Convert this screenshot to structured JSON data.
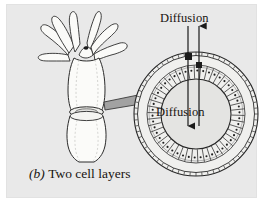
{
  "figure": {
    "caption_letter": "(b)",
    "caption_text": "Two cell layers",
    "panel_color": "#e9e9e9",
    "ink_color": "#1a1a1a",
    "page_color": "#ffffff"
  },
  "labels": {
    "diffusion_top": "Diffusion",
    "diffusion_inner": "Diffusion"
  },
  "organism": {
    "name": "hydra-polyp",
    "tentacle_count": 7,
    "body_color": "#f7f7f5",
    "outline_color": "#2a2a2a"
  },
  "cross_section": {
    "name": "two-cell-layer-ring",
    "center_x": 196,
    "center_y": 114,
    "outer_radius": 62,
    "inner_radius": 35,
    "outer_layer_cells": 64,
    "inner_layer_cells": 46,
    "lumen_color": "#e4e4e4",
    "cell_fill": "#fbfbfb"
  },
  "arrows": {
    "inward": {
      "direction": "down",
      "label": "Diffusion"
    },
    "outward": {
      "direction": "up",
      "label": "Diffusion"
    },
    "pointer": {
      "name": "block-pointer-arrow",
      "color": "#9a9a9a",
      "from": "organism-body",
      "to": "cross-section"
    }
  }
}
